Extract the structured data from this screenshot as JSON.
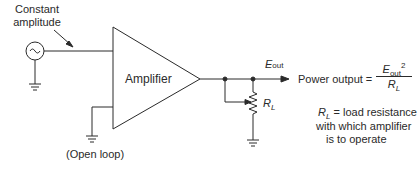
{
  "diagram": {
    "colors": {
      "line": "#2a2a2a",
      "background": "#ffffff"
    },
    "labels": {
      "input_note_line1": "Constant",
      "input_note_line2": "amplitude",
      "amplifier": "Amplifier",
      "open_loop": "(Open loop)",
      "e_out_symbol": "E",
      "e_out_sub": "out",
      "r_l_symbol": "R",
      "r_l_sub": "L"
    },
    "formula": {
      "lhs": "Power output =",
      "numerator_symbol": "E",
      "numerator_sub": "out",
      "numerator_exp": "2",
      "denominator_symbol": "R",
      "denominator_sub": "L"
    },
    "definition": {
      "symbol": "R",
      "sub": "L",
      "line1": "= load resistance",
      "line2": "with which amplifier",
      "line3": "is to operate"
    },
    "components": [
      {
        "name": "ac-source",
        "glyph": "~"
      },
      {
        "name": "amplifier",
        "shape": "triangle"
      },
      {
        "name": "load-resistor",
        "shape": "zigzag-with-wiper"
      },
      {
        "name": "ground",
        "count": 3
      }
    ]
  }
}
